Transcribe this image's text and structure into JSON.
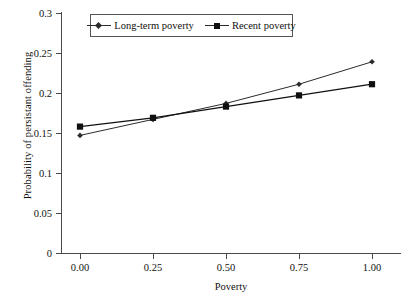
{
  "chart_data": {
    "type": "line",
    "title": "",
    "xlabel": "Poverty",
    "ylabel": "Probability of persistant offending",
    "categories": [
      "0.00",
      "0.25",
      "0.50",
      "0.75",
      "1.00"
    ],
    "x": [
      0.0,
      0.25,
      0.5,
      0.75,
      1.0
    ],
    "xlim": [
      0.0,
      1.0
    ],
    "ylim": [
      0,
      0.3
    ],
    "ytick_labels": [
      "0",
      "0.05",
      "0.1",
      "0.15",
      "0.2",
      "0.25",
      "0.3"
    ],
    "ytick_values": [
      0,
      0.05,
      0.1,
      0.15,
      0.2,
      0.25,
      0.3
    ],
    "grid": false,
    "legend_position": "top-center",
    "series": [
      {
        "name": "Long-term poverty",
        "marker": "diamond",
        "color": "#2b2b2b",
        "values": [
          0.147,
          0.167,
          0.187,
          0.211,
          0.239
        ]
      },
      {
        "name": "Recent poverty",
        "marker": "square",
        "color": "#101010",
        "values": [
          0.158,
          0.169,
          0.183,
          0.197,
          0.211
        ]
      }
    ]
  }
}
